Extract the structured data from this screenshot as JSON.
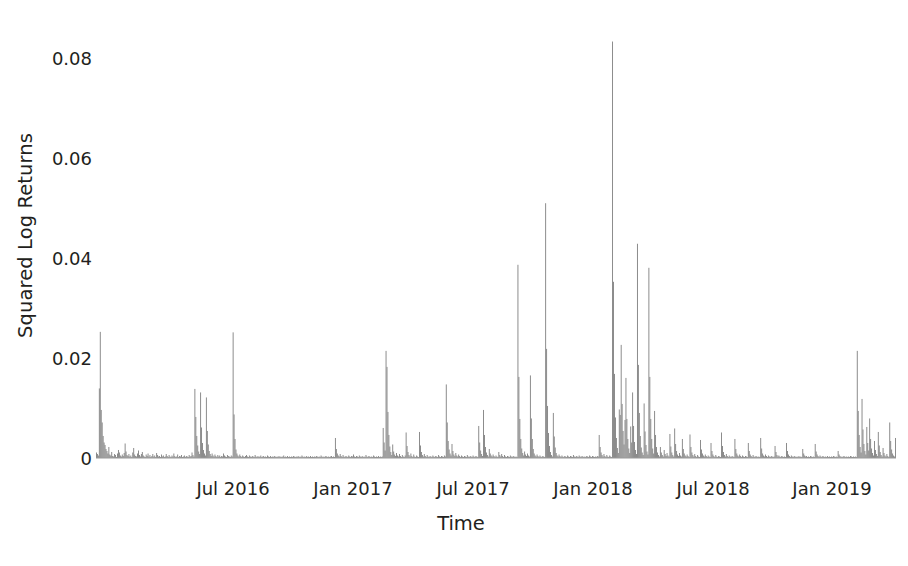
{
  "chart_data": {
    "type": "bar",
    "title": "",
    "subtitle": "",
    "xlabel": "Time",
    "ylabel": "Squared Log Returns",
    "grid": false,
    "legend": false,
    "legend_position": "none",
    "bar_color": "#7d7d7d",
    "background_color": "#ffffff",
    "text_color": "#231f20",
    "ylim": [
      0,
      0.0875
    ],
    "yticks": [
      0,
      0.02,
      0.04,
      0.06,
      0.08
    ],
    "ytick_labels": [
      "0",
      "0.02",
      "0.04",
      "0.06",
      "0.08"
    ],
    "xlim": [
      "2016-03-10",
      "2019-03-20"
    ],
    "xticks": [
      "2016-07-01",
      "2017-01-01",
      "2017-07-01",
      "2018-01-01",
      "2018-07-01",
      "2019-01-01"
    ],
    "xtick_labels": [
      "Jul 2016",
      "Jan 2017",
      "Jul 2017",
      "Jan 2018",
      "Jul 2018",
      "Jan 2019"
    ],
    "x_start_fraction": 0.0,
    "x_end_fraction": 1.0,
    "n_points": 775,
    "max_value": 0.0832,
    "max_value_x": "Jan 2018",
    "annotations": [],
    "values": [
      0.0011,
      0.0008,
      0.0005,
      0.0139,
      0.0252,
      0.0096,
      0.0071,
      0.0044,
      0.0031,
      0.0026,
      0.0018,
      0.0014,
      0.0009,
      0.0022,
      0.0007,
      0.0005,
      0.0012,
      0.0004,
      0.0003,
      0.0008,
      0.0006,
      0.0002,
      0.0009,
      0.0016,
      0.0011,
      0.0005,
      0.0003,
      0.0007,
      0.0004,
      0.001,
      0.0029,
      0.0013,
      0.0006,
      0.0004,
      0.0008,
      0.0003,
      0.0005,
      0.0002,
      0.0011,
      0.002,
      0.0007,
      0.0004,
      0.0003,
      0.0009,
      0.0015,
      0.0006,
      0.0003,
      0.0008,
      0.0012,
      0.0005,
      0.0003,
      0.0002,
      0.0007,
      0.0004,
      0.0009,
      0.0003,
      0.0006,
      0.0002,
      0.0004,
      0.0008,
      0.0003,
      0.0005,
      0.0002,
      0.001,
      0.0006,
      0.0003,
      0.0004,
      0.0002,
      0.0007,
      0.0003,
      0.0005,
      0.0002,
      0.0003,
      0.0008,
      0.0004,
      0.0002,
      0.0006,
      0.0003,
      0.0002,
      0.0005,
      0.0003,
      0.0009,
      0.0004,
      0.0002,
      0.0003,
      0.0007,
      0.0002,
      0.0004,
      0.0003,
      0.0006,
      0.0002,
      0.0003,
      0.0005,
      0.0002,
      0.0004,
      0.0003,
      0.0002,
      0.0006,
      0.0003,
      0.0004,
      0.0011,
      0.0006,
      0.0003,
      0.0138,
      0.0082,
      0.0044,
      0.0025,
      0.0013,
      0.0008,
      0.0131,
      0.0061,
      0.003,
      0.0016,
      0.0009,
      0.0005,
      0.0121,
      0.0054,
      0.0027,
      0.0014,
      0.0008,
      0.0004,
      0.0009,
      0.0005,
      0.0003,
      0.0007,
      0.0004,
      0.0002,
      0.0006,
      0.0003,
      0.0005,
      0.0002,
      0.0004,
      0.0003,
      0.0009,
      0.0005,
      0.0003,
      0.0002,
      0.0006,
      0.0004,
      0.0003,
      0.0002,
      0.0005,
      0.0003,
      0.0251,
      0.0087,
      0.0038,
      0.0017,
      0.0009,
      0.0005,
      0.0003,
      0.0007,
      0.0004,
      0.0002,
      0.0005,
      0.0003,
      0.0002,
      0.0004,
      0.0006,
      0.0003,
      0.0002,
      0.0005,
      0.0003,
      0.0002,
      0.0004,
      0.0003,
      0.0002,
      0.0006,
      0.0003,
      0.0002,
      0.0004,
      0.0002,
      0.0003,
      0.0005,
      0.0002,
      0.0003,
      0.0004,
      0.0002,
      0.0003,
      0.0002,
      0.0005,
      0.0003,
      0.0002,
      0.0004,
      0.0002,
      0.0003,
      0.0002,
      0.0004,
      0.0003,
      0.0002,
      0.0003,
      0.0002,
      0.0004,
      0.0002,
      0.0003,
      0.0002,
      0.0003,
      0.0005,
      0.0002,
      0.0003,
      0.0002,
      0.0004,
      0.0002,
      0.0003,
      0.0002,
      0.0003,
      0.0002,
      0.0004,
      0.0003,
      0.0002,
      0.0003,
      0.0002,
      0.0004,
      0.0002,
      0.0003,
      0.0002,
      0.0005,
      0.0003,
      0.0002,
      0.0003,
      0.0002,
      0.0004,
      0.0002,
      0.0003,
      0.0002,
      0.0004,
      0.0002,
      0.0003,
      0.0002,
      0.0003,
      0.0002,
      0.0004,
      0.0003,
      0.0002,
      0.0003,
      0.0002,
      0.0005,
      0.0003,
      0.0002,
      0.0003,
      0.0002,
      0.0004,
      0.0003,
      0.0002,
      0.0003,
      0.0002,
      0.0003,
      0.0004,
      0.0002,
      0.0003,
      0.0002,
      0.004,
      0.0018,
      0.0009,
      0.0005,
      0.0003,
      0.0008,
      0.0004,
      0.0002,
      0.0006,
      0.0003,
      0.0002,
      0.0004,
      0.0003,
      0.0002,
      0.0005,
      0.0003,
      0.0002,
      0.0004,
      0.0003,
      0.0007,
      0.0003,
      0.0002,
      0.0004,
      0.0003,
      0.0002,
      0.0005,
      0.0003,
      0.0002,
      0.0004,
      0.0002,
      0.0003,
      0.0002,
      0.0006,
      0.0003,
      0.0002,
      0.0004,
      0.0003,
      0.0002,
      0.0003,
      0.0002,
      0.0005,
      0.0003,
      0.0002,
      0.0003,
      0.0002,
      0.0004,
      0.0002,
      0.0003,
      0.0002,
      0.0003,
      0.006,
      0.0031,
      0.0015,
      0.0214,
      0.0182,
      0.0092,
      0.0046,
      0.0023,
      0.0012,
      0.0006,
      0.0027,
      0.0013,
      0.0007,
      0.0004,
      0.001,
      0.0005,
      0.0003,
      0.0008,
      0.0004,
      0.0002,
      0.0006,
      0.0003,
      0.0002,
      0.0005,
      0.0051,
      0.0024,
      0.0012,
      0.0006,
      0.0003,
      0.0009,
      0.0004,
      0.0002,
      0.0007,
      0.0003,
      0.0002,
      0.0005,
      0.0003,
      0.0002,
      0.0052,
      0.0025,
      0.0012,
      0.0006,
      0.0003,
      0.0008,
      0.0004,
      0.0002,
      0.0006,
      0.0003,
      0.0002,
      0.0004,
      0.0003,
      0.0002,
      0.0005,
      0.0003,
      0.0002,
      0.0004,
      0.0003,
      0.0002,
      0.0006,
      0.0003,
      0.0002,
      0.0004,
      0.0003,
      0.0002,
      0.0005,
      0.0003,
      0.0147,
      0.0071,
      0.0034,
      0.0017,
      0.0009,
      0.0005,
      0.0028,
      0.0014,
      0.0007,
      0.0004,
      0.001,
      0.0005,
      0.0003,
      0.0007,
      0.0004,
      0.0002,
      0.0005,
      0.0003,
      0.0002,
      0.0004,
      0.0003,
      0.0002,
      0.0006,
      0.0003,
      0.0002,
      0.0004,
      0.0003,
      0.0002,
      0.0005,
      0.0003,
      0.0002,
      0.0004,
      0.0003,
      0.0002,
      0.0064,
      0.0031,
      0.0015,
      0.0008,
      0.0004,
      0.0096,
      0.0046,
      0.0022,
      0.0011,
      0.0006,
      0.0003,
      0.0018,
      0.0009,
      0.0005,
      0.0003,
      0.0007,
      0.0004,
      0.0002,
      0.0005,
      0.0003,
      0.0002,
      0.0012,
      0.0006,
      0.0003,
      0.0008,
      0.0004,
      0.0002,
      0.0006,
      0.0003,
      0.0002,
      0.0004,
      0.0003,
      0.0002,
      0.0005,
      0.0003,
      0.0002,
      0.0004,
      0.0003,
      0.0002,
      0.0003,
      0.0002,
      0.0386,
      0.0162,
      0.0078,
      0.0038,
      0.0019,
      0.001,
      0.0005,
      0.0013,
      0.0007,
      0.0004,
      0.0009,
      0.0005,
      0.0003,
      0.0165,
      0.0079,
      0.0038,
      0.0018,
      0.0009,
      0.0005,
      0.0003,
      0.0007,
      0.0004,
      0.0002,
      0.0005,
      0.0003,
      0.0002,
      0.0004,
      0.0003,
      0.0002,
      0.0509,
      0.0218,
      0.0104,
      0.005,
      0.0024,
      0.0012,
      0.0006,
      0.0003,
      0.009,
      0.0043,
      0.0021,
      0.001,
      0.0005,
      0.0003,
      0.0007,
      0.0004,
      0.0002,
      0.0005,
      0.0003,
      0.0002,
      0.0004,
      0.0003,
      0.0002,
      0.0005,
      0.0003,
      0.0002,
      0.0004,
      0.0003,
      0.0002,
      0.0006,
      0.0003,
      0.0002,
      0.0004,
      0.0003,
      0.0002,
      0.0005,
      0.0003,
      0.0002,
      0.0004,
      0.0003,
      0.0002,
      0.0003,
      0.0002,
      0.0004,
      0.0003,
      0.0002,
      0.0005,
      0.0003,
      0.0002,
      0.0004,
      0.0003,
      0.0002,
      0.0003,
      0.0002,
      0.0004,
      0.0003,
      0.0046,
      0.0022,
      0.0011,
      0.0006,
      0.0003,
      0.0008,
      0.0004,
      0.0002,
      0.0006,
      0.0003,
      0.0002,
      0.0005,
      0.0003,
      0.0002,
      0.0832,
      0.0352,
      0.0168,
      0.0081,
      0.004,
      0.002,
      0.001,
      0.0097,
      0.0086,
      0.0226,
      0.0108,
      0.0054,
      0.0027,
      0.0076,
      0.016,
      0.0078,
      0.0038,
      0.0019,
      0.001,
      0.0063,
      0.0031,
      0.0131,
      0.0064,
      0.0032,
      0.0016,
      0.0008,
      0.0428,
      0.0186,
      0.009,
      0.0044,
      0.0021,
      0.0011,
      0.0006,
      0.0109,
      0.0053,
      0.0026,
      0.0013,
      0.0007,
      0.038,
      0.0162,
      0.0078,
      0.0038,
      0.0019,
      0.0009,
      0.0094,
      0.0046,
      0.0022,
      0.0011,
      0.0006,
      0.0003,
      0.0022,
      0.0011,
      0.0006,
      0.0003,
      0.0016,
      0.0008,
      0.0004,
      0.001,
      0.0005,
      0.0003,
      0.0048,
      0.0023,
      0.0011,
      0.0006,
      0.0003,
      0.0059,
      0.0028,
      0.0014,
      0.0007,
      0.0004,
      0.001,
      0.0005,
      0.0003,
      0.0038,
      0.0018,
      0.0009,
      0.0005,
      0.0003,
      0.0007,
      0.0004,
      0.0002,
      0.0047,
      0.0022,
      0.0011,
      0.0006,
      0.0003,
      0.0008,
      0.0004,
      0.0002,
      0.0006,
      0.0003,
      0.0002,
      0.0036,
      0.0017,
      0.0009,
      0.0005,
      0.0003,
      0.0007,
      0.0004,
      0.0002,
      0.0005,
      0.0003,
      0.0002,
      0.003,
      0.0014,
      0.0007,
      0.0004,
      0.0002,
      0.0006,
      0.0003,
      0.0002,
      0.0004,
      0.0003,
      0.0002,
      0.0051,
      0.0024,
      0.0012,
      0.0006,
      0.0003,
      0.0008,
      0.0004,
      0.0002,
      0.0005,
      0.0003,
      0.0002,
      0.0004,
      0.0003,
      0.0002,
      0.0038,
      0.0018,
      0.0009,
      0.0005,
      0.0003,
      0.0007,
      0.0004,
      0.0002,
      0.0005,
      0.0003,
      0.0002,
      0.0004,
      0.0003,
      0.0002,
      0.003,
      0.0014,
      0.0007,
      0.0004,
      0.0002,
      0.0006,
      0.0003,
      0.0002,
      0.0004,
      0.0003,
      0.0002,
      0.0003,
      0.0002,
      0.004,
      0.0019,
      0.0009,
      0.0005,
      0.0003,
      0.0007,
      0.0004,
      0.0002,
      0.0005,
      0.0003,
      0.0002,
      0.0004,
      0.0003,
      0.0002,
      0.0003,
      0.0024,
      0.0012,
      0.0006,
      0.0003,
      0.0005,
      0.0003,
      0.0002,
      0.0004,
      0.0003,
      0.0002,
      0.0003,
      0.0002,
      0.003,
      0.0014,
      0.0007,
      0.0004,
      0.0002,
      0.0005,
      0.0003,
      0.0002,
      0.0004,
      0.0003,
      0.0002,
      0.0003,
      0.0002,
      0.0004,
      0.0002,
      0.0003,
      0.0002,
      0.0018,
      0.0009,
      0.0005,
      0.0003,
      0.0004,
      0.0002,
      0.0003,
      0.0002,
      0.0004,
      0.0003,
      0.0002,
      0.0003,
      0.0002,
      0.0028,
      0.0013,
      0.0007,
      0.0004,
      0.0002,
      0.0005,
      0.0003,
      0.0002,
      0.0004,
      0.0003,
      0.0002,
      0.0003,
      0.0002,
      0.0004,
      0.0002,
      0.0003,
      0.0002,
      0.0003,
      0.0002,
      0.0004,
      0.0003,
      0.0002,
      0.0003,
      0.0002,
      0.0014,
      0.0007,
      0.0004,
      0.0002,
      0.0003,
      0.0002,
      0.0004,
      0.0003,
      0.0002,
      0.0003,
      0.0002,
      0.0003,
      0.0002,
      0.0004,
      0.0003,
      0.0002,
      0.0003,
      0.0002,
      0.0003,
      0.0002,
      0.0214,
      0.0094,
      0.0046,
      0.0022,
      0.0011,
      0.0118,
      0.0057,
      0.0028,
      0.0014,
      0.0007,
      0.0062,
      0.003,
      0.0015,
      0.0079,
      0.0038,
      0.0019,
      0.001,
      0.0005,
      0.0034,
      0.0016,
      0.0008,
      0.0004,
      0.0052,
      0.0025,
      0.0012,
      0.0006,
      0.0003,
      0.002,
      0.001,
      0.0005,
      0.0003,
      0.0008,
      0.0004,
      0.0002,
      0.0071,
      0.0034,
      0.0017,
      0.0009,
      0.0005,
      0.0003,
      0.004
    ]
  }
}
